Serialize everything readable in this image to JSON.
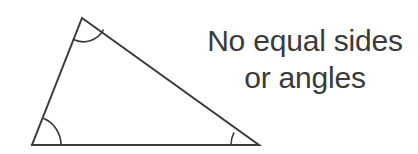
{
  "figure": {
    "name": "scalene-triangle-diagram",
    "background_color": "#ffffff",
    "stroke_color": "#3a3a3a",
    "text_color": "#3a3a3a",
    "stroke_width": 2
  },
  "caption": {
    "line1": "No equal sides",
    "line2": "or angles"
  },
  "shape": {
    "type": "triangle",
    "classification": "scalene",
    "vertices": [
      {
        "name": "apex",
        "x": 82,
        "y": 18
      },
      {
        "name": "bottom-left",
        "x": 32,
        "y": 145
      },
      {
        "name": "bottom-right",
        "x": 259,
        "y": 145
      }
    ],
    "sides": [
      {
        "name": "left-side",
        "from": "bottom-left",
        "to": "apex"
      },
      {
        "name": "hypotenuse",
        "from": "apex",
        "to": "bottom-right"
      },
      {
        "name": "base",
        "from": "bottom-left",
        "to": "bottom-right"
      }
    ],
    "angle_arcs": [
      {
        "name": "apex-angle-arc",
        "vertex": "apex",
        "radius": 23
      },
      {
        "name": "bottom-left-angle-arc",
        "vertex": "bottom-left",
        "radius": 29
      },
      {
        "name": "bottom-right-angle-arc",
        "vertex": "bottom-right",
        "radius": 28
      }
    ]
  }
}
